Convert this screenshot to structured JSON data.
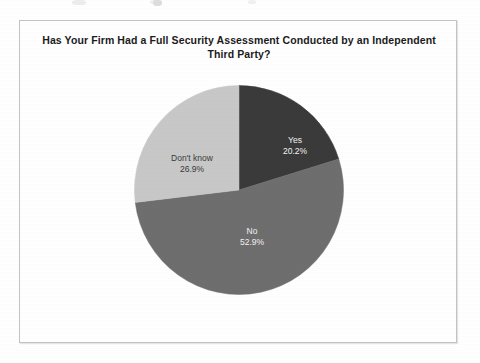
{
  "page": {
    "background_color": "#ffffff",
    "frame_border_color": "#c3c3c3"
  },
  "chart_data": {
    "type": "pie",
    "title": "Has Your Firm Had a Full Security Assessment Conducted by an Independent Third Party?",
    "title_line1": "Has Your Firm Had a Full Security Assessment Conducted by an Independent",
    "title_line2": "Third Party?",
    "categories": [
      "Yes",
      "No",
      "Don't know"
    ],
    "values": [
      20.2,
      52.9,
      26.9
    ],
    "value_labels": [
      "20.2%",
      "52.9%",
      "26.9%"
    ],
    "units": "percent",
    "total": 100.0,
    "start_angle_deg": 0,
    "direction": "clockwise",
    "legend": "none",
    "data_labels_inside": true,
    "slices": [
      {
        "name": "Yes",
        "value": 20.2,
        "value_label": "20.2%",
        "color": "#3a3a3a",
        "label_text_color": "#f2f2f2",
        "start_angle_deg": 0,
        "end_angle_deg": 72.72
      },
      {
        "name": "No",
        "value": 52.9,
        "value_label": "52.9%",
        "color": "#6e6e6e",
        "label_text_color": "#f2f2f2",
        "start_angle_deg": 72.72,
        "end_angle_deg": 263.16
      },
      {
        "name": "Don't know",
        "value": 26.9,
        "value_label": "26.9%",
        "color": "#c8c8c8",
        "label_text_color": "#3a3a3a",
        "start_angle_deg": 263.16,
        "end_angle_deg": 360
      }
    ]
  }
}
